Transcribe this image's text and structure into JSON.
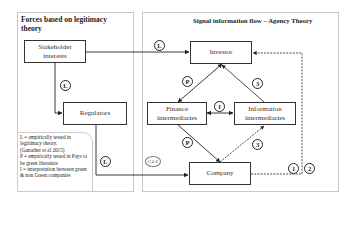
{
  "left_panel": {
    "title": "Forces based on legitimacy theory"
  },
  "right_panel": {
    "title": "Signal information flow – Agency Theory"
  },
  "nodes": {
    "stakeholder": "Stakeholder interests",
    "regulators": "Regulators",
    "investor": "Investor",
    "finance": "Finance intermediaries",
    "information": "Information intermediaries",
    "company": "Company"
  },
  "badges": {
    "stakeholder_investor": "L",
    "stakeholder_regulators": "L",
    "regulators_company": "L",
    "c46": "C4-6",
    "investor_finance": "P",
    "finance_company": "P",
    "finance_information": "I",
    "information_investor": "3",
    "company_information": "3",
    "feedback_1": "1",
    "feedback_2": "2"
  },
  "legend": {
    "lines": [
      "L = empirically tested in legitimacy theory.",
      "(Gunather et al 2015)",
      "P = empirically tested in Pays to be green literature",
      "I = interpretation between green & non Green companies"
    ]
  },
  "colors": {
    "line": "#222222",
    "panel_border": "#c8c8c8"
  }
}
